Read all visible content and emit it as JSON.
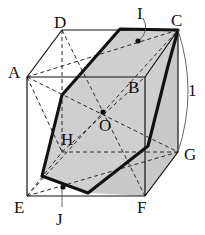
{
  "figure": {
    "kind": "geometry-diagram",
    "background_color": "#ffffff",
    "ink_color": "#111111",
    "face_fill_color": "#c9c9c9",
    "hexagon_fill_color": "#cfcfcf",
    "edge_length_label": "1",
    "labels": [
      {
        "name": "D",
        "text": "D",
        "x": 54,
        "y": 14
      },
      {
        "name": "I",
        "text": "I",
        "x": 137,
        "y": 5
      },
      {
        "name": "C",
        "text": "C",
        "x": 171,
        "y": 12
      },
      {
        "name": "A",
        "text": "A",
        "x": 8,
        "y": 64
      },
      {
        "name": "B",
        "text": "B",
        "x": 128,
        "y": 79
      },
      {
        "name": "one",
        "text": "1",
        "x": 188,
        "y": 82
      },
      {
        "name": "O",
        "text": "O",
        "x": 99,
        "y": 117
      },
      {
        "name": "H",
        "text": "H",
        "x": 61,
        "y": 131
      },
      {
        "name": "G",
        "text": "G",
        "x": 184,
        "y": 146
      },
      {
        "name": "E",
        "text": "E",
        "x": 14,
        "y": 199
      },
      {
        "name": "J",
        "text": "J",
        "x": 56,
        "y": 211
      },
      {
        "name": "F",
        "text": "F",
        "x": 137,
        "y": 199
      }
    ],
    "vertices": {
      "A": {
        "x": 27,
        "y": 77
      },
      "B": {
        "x": 145,
        "y": 77
      },
      "C": {
        "x": 178,
        "y": 30
      },
      "D": {
        "x": 62,
        "y": 30
      },
      "E": {
        "x": 27,
        "y": 196
      },
      "F": {
        "x": 145,
        "y": 196
      },
      "G": {
        "x": 178,
        "y": 152
      },
      "H": {
        "x": 62,
        "y": 152
      },
      "I": {
        "x": 138,
        "y": 42
      },
      "J": {
        "x": 63,
        "y": 187
      },
      "O": {
        "x": 103,
        "y": 112
      }
    },
    "marked_points": [
      "I",
      "J",
      "O"
    ],
    "cross_section_polygon": [
      {
        "x": 120,
        "y": 29
      },
      {
        "x": 178,
        "y": 30
      },
      {
        "x": 168,
        "y": 66
      },
      {
        "x": 148,
        "y": 146
      },
      {
        "x": 88,
        "y": 193
      },
      {
        "x": 42,
        "y": 176
      },
      {
        "x": 62,
        "y": 95
      }
    ],
    "measure_arc": {
      "from": {
        "x": 178,
        "y": 30
      },
      "to": {
        "x": 178,
        "y": 152
      },
      "bulge_x": 197
    }
  }
}
